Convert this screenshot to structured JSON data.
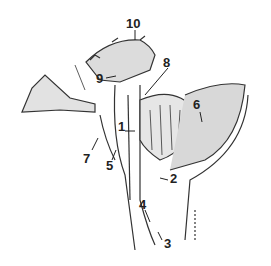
{
  "diagram": {
    "type": "anatomical-sagittal-section",
    "colors": {
      "line": "#333333",
      "fill": "#d8d8d8",
      "background": "#ffffff"
    },
    "labels": [
      {
        "id": "1",
        "text": "1",
        "x": 118,
        "y": 126
      },
      {
        "id": "2",
        "text": "2",
        "x": 170,
        "y": 178
      },
      {
        "id": "3",
        "text": "3",
        "x": 166,
        "y": 243
      },
      {
        "id": "4",
        "text": "4",
        "x": 139,
        "y": 204
      },
      {
        "id": "5",
        "text": "5",
        "x": 106,
        "y": 165
      },
      {
        "id": "6",
        "text": "6",
        "x": 193,
        "y": 101
      },
      {
        "id": "7",
        "text": "7",
        "x": 83,
        "y": 153
      },
      {
        "id": "8",
        "text": "8",
        "x": 166,
        "y": 58
      },
      {
        "id": "9",
        "text": "9",
        "x": 96,
        "y": 73
      },
      {
        "id": "10",
        "text": "10",
        "x": 127,
        "y": 17
      }
    ]
  }
}
